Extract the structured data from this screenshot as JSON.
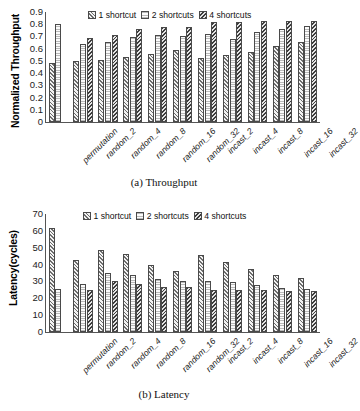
{
  "figure": {
    "panels": [
      {
        "id": "a",
        "caption": "(a) Throughput",
        "ylabel": "Normalized Throughput"
      },
      {
        "id": "b",
        "caption": "(b) Latency",
        "ylabel": "Latency(cycles)"
      }
    ]
  },
  "legend": {
    "entries": [
      {
        "label": "1 shortcut",
        "pattern": "diagonal-hatch-medium"
      },
      {
        "label": "2 shortcuts",
        "pattern": "horizontal-lines-light"
      },
      {
        "label": "4 shortcuts",
        "pattern": "diagonal-hatch-dark"
      }
    ]
  },
  "chart_data": [
    {
      "type": "bar",
      "title": "(a) Throughput",
      "xlabel": "",
      "ylabel": "Normalized Throughput",
      "ylim": [
        0,
        0.9
      ],
      "yticks": [
        "0",
        "0.1",
        "0.2",
        "0.3",
        "0.4",
        "0.5",
        "0.6",
        "0.7",
        "0.8",
        "0.9"
      ],
      "grid": false,
      "legend_position": "top-center",
      "categories": [
        "permutation",
        "random_2",
        "random_4",
        "random_8",
        "random_16",
        "random_32",
        "incast_2",
        "incast_4",
        "incast_8",
        "incast_16",
        "incast_32"
      ],
      "series": [
        {
          "name": "1 shortcut",
          "values": [
            0.48,
            0.5,
            0.51,
            0.535,
            0.56,
            0.59,
            0.52,
            0.545,
            0.575,
            0.62,
            0.655
          ]
        },
        {
          "name": "2 shortcuts",
          "values": [
            0.805,
            0.635,
            0.655,
            0.695,
            0.715,
            0.7,
            0.72,
            0.68,
            0.74,
            0.765,
            0.785
          ]
        },
        {
          "name": "4 shortcuts",
          "values": [
            null,
            0.685,
            0.715,
            0.76,
            0.775,
            0.775,
            0.815,
            0.815,
            0.825,
            0.83,
            0.83
          ]
        }
      ]
    },
    {
      "type": "bar",
      "title": "(b) Latency",
      "xlabel": "",
      "ylabel": "Latency(cycles)",
      "ylim": [
        0,
        70
      ],
      "yticks": [
        "0",
        "10",
        "20",
        "30",
        "40",
        "50",
        "60",
        "70"
      ],
      "grid": false,
      "legend_position": "top-center",
      "categories": [
        "permutation",
        "random_2",
        "random_4",
        "random_8",
        "random_16",
        "random_32",
        "incast_2",
        "incast_4",
        "incast_8",
        "incast_16",
        "incast_32"
      ],
      "series": [
        {
          "name": "1 shortcut",
          "values": [
            61.5,
            43,
            48.5,
            46,
            40,
            36,
            45.5,
            41.5,
            37.5,
            34,
            32
          ]
        },
        {
          "name": "2 shortcuts",
          "values": [
            25.5,
            28.5,
            35,
            34,
            31.5,
            30,
            30.5,
            29.5,
            28,
            26,
            25.5
          ]
        },
        {
          "name": "4 shortcuts",
          "values": [
            null,
            25,
            30,
            28.5,
            27,
            27,
            25,
            25,
            25,
            24.5,
            24.5
          ]
        }
      ]
    }
  ]
}
